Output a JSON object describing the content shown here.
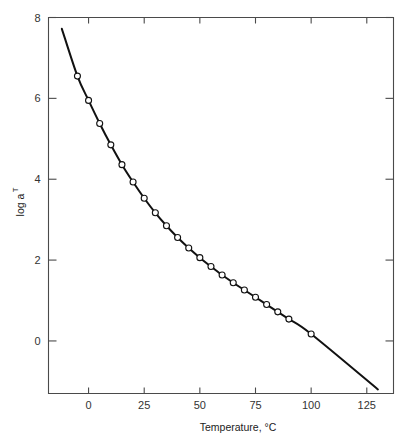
{
  "chart_data": {
    "type": "line",
    "title": "",
    "subtitle": "",
    "xlabel": "Temperature,  °C",
    "ylabel": "log a",
    "ylabel_subscript": "T",
    "xlim": [
      -18,
      137
    ],
    "ylim": [
      -1.3,
      8.0
    ],
    "xticks": [
      0,
      25,
      50,
      75,
      100,
      125
    ],
    "xtick_labels": [
      "0",
      "25",
      "50",
      "75",
      "100",
      "125"
    ],
    "yticks": [
      0,
      2,
      4,
      6,
      8
    ],
    "ytick_labels": [
      "0",
      "2",
      "4",
      "6",
      "8"
    ],
    "grid": false,
    "legend": "none",
    "frame": "box",
    "series": [
      {
        "name": "log aT vs Temperature",
        "marker": "open-circle",
        "line": "solid",
        "x": [
          -12.0,
          -5.0,
          0.0,
          5.0,
          10.0,
          15.0,
          20.0,
          25.0,
          30.0,
          35.0,
          40.0,
          45.0,
          50.0,
          55.0,
          60.0,
          65.0,
          70.0,
          75.0,
          80.0,
          85.0,
          90.0,
          100.0,
          130.0
        ],
        "y": [
          7.72,
          6.55,
          5.95,
          5.38,
          4.85,
          4.36,
          3.93,
          3.53,
          3.17,
          2.85,
          2.56,
          2.3,
          2.06,
          1.84,
          1.63,
          1.44,
          1.26,
          1.08,
          0.9,
          0.72,
          0.54,
          0.17,
          -1.2
        ],
        "marker_x": [
          -5.0,
          0.0,
          5.0,
          10.0,
          15.0,
          20.0,
          25.0,
          30.0,
          35.0,
          40.0,
          45.0,
          50.0,
          55.0,
          60.0,
          65.0,
          70.0,
          75.0,
          80.0,
          85.0,
          90.0,
          100.0
        ],
        "marker_y": [
          6.55,
          5.95,
          5.38,
          4.85,
          4.36,
          3.93,
          3.53,
          3.17,
          2.85,
          2.56,
          2.3,
          2.06,
          1.84,
          1.63,
          1.44,
          1.26,
          1.08,
          0.9,
          0.72,
          0.54,
          0.17
        ]
      }
    ]
  },
  "colors": {
    "curve": "#111111",
    "axis": "#4a4a4a",
    "marker_fill": "#ffffff",
    "background": "#ffffff"
  }
}
